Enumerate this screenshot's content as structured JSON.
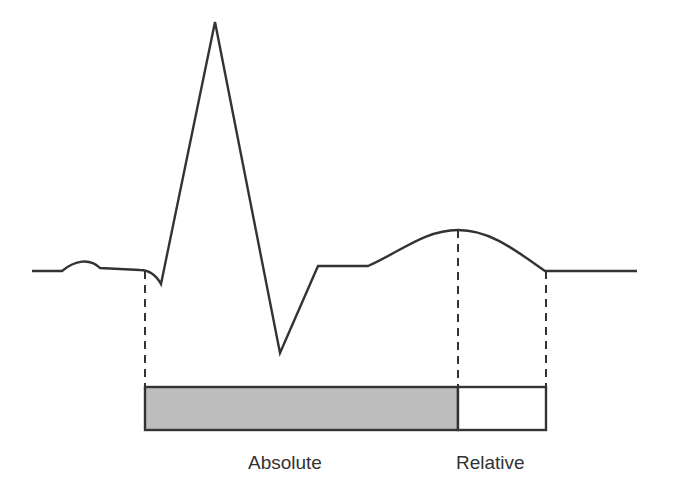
{
  "diagram": {
    "type": "ecg-refractory-period",
    "colors": {
      "trace": "#333333",
      "absolute_fill": "#bdbdbd",
      "relative_fill": "#ffffff",
      "border": "#333333"
    },
    "trace_points": "32,271 62,271 C 75,260 90,258 100,268 L 140,270 C 150,270 156,275 161,284 L 215,22 L 280,353 L 318,266 L 368,266 C 400,252 425,230 458,230 C 490,230 515,250 545,271 L 637,271",
    "periods": [
      {
        "name": "absolute",
        "label": "Absolute",
        "x_start": 145,
        "x_end": 458
      },
      {
        "name": "relative",
        "label": "Relative",
        "x_start": 458,
        "x_end": 546
      }
    ],
    "dashed_markers": [
      {
        "x": 145,
        "y_top": 271,
        "y_bottom": 387
      },
      {
        "x": 458,
        "y_top": 230,
        "y_bottom": 387
      },
      {
        "x": 546,
        "y_top": 271,
        "y_bottom": 387
      }
    ]
  }
}
